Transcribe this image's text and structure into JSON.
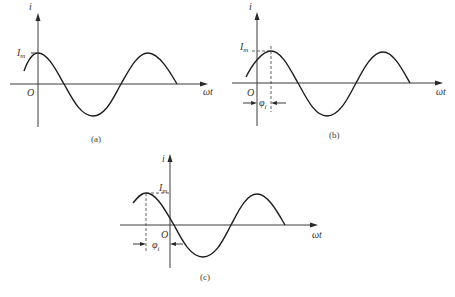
{
  "figure": {
    "panels": [
      {
        "id": "a",
        "caption": "(a)",
        "y_axis_label": "i",
        "x_axis_label": "ωt",
        "origin_label": "O",
        "peak_label": "I",
        "peak_label_sub": "m",
        "description": "cosine-like current wave: maximum Im at ωt = 0 (initial phase φi = +90°)"
      },
      {
        "id": "b",
        "caption": "(b)",
        "y_axis_label": "i",
        "x_axis_label": "ωt",
        "origin_label": "O",
        "peak_label": "I",
        "peak_label_sub": "m",
        "phase_label": "φ",
        "phase_label_sub": "i",
        "description": "current wave with peak shifted right of origin by φi (dashed guide lines to Im)"
      },
      {
        "id": "c",
        "caption": "(c)",
        "y_axis_label": "i",
        "x_axis_label": "ωt",
        "origin_label": "O",
        "peak_label": "I",
        "peak_label_sub": "m",
        "phase_label": "φ",
        "phase_label_sub": "i",
        "description": "current wave with peak left of origin by φi (dashed guide lines to Im)"
      }
    ],
    "colors": {
      "curve": "#1e1e1e",
      "axis": "#3a3a3a",
      "text": "#333333"
    }
  }
}
